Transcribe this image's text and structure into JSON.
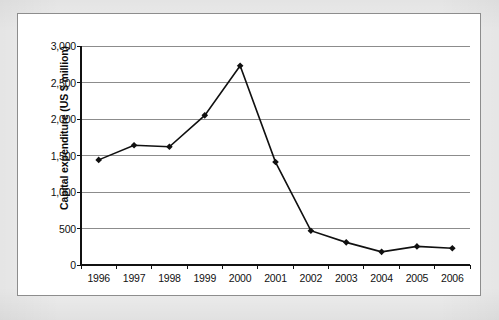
{
  "figure": {
    "background_color": "#ffffff",
    "frame_color": "#8d8d8d",
    "page_color": "#ededed"
  },
  "chart_data": {
    "type": "line",
    "title": "",
    "subtitle": "",
    "xlabel": "",
    "ylabel": "Capital expenditure (US $ million)",
    "categories": [
      "1996",
      "1997",
      "1998",
      "1999",
      "2000",
      "2001",
      "2002",
      "2003",
      "2004",
      "2005",
      "2006"
    ],
    "values": [
      1440,
      1640,
      1620,
      2050,
      2730,
      1410,
      470,
      310,
      180,
      255,
      230
    ],
    "series": [
      {
        "name": "Capital expenditure",
        "values": [
          1440,
          1640,
          1620,
          2050,
          2730,
          1410,
          470,
          310,
          180,
          255,
          230
        ],
        "line_color": "#101010",
        "marker": "diamond",
        "marker_color": "#101010"
      }
    ],
    "ylim": [
      0,
      3000
    ],
    "ytick_values": [
      0,
      500,
      1000,
      1500,
      2000,
      2500,
      3000
    ],
    "ytick_labels": [
      "0",
      "500",
      "1,000",
      "1,500",
      "2,000",
      "2,500",
      "3,000"
    ],
    "xtick_labels": [
      "1996",
      "1997",
      "1998",
      "1999",
      "2000",
      "2001",
      "2002",
      "2003",
      "2004",
      "2005",
      "2006"
    ],
    "grid": "horizontal",
    "gridline_color": "#8c8c8c",
    "legend": "none",
    "legend_position": "none"
  }
}
